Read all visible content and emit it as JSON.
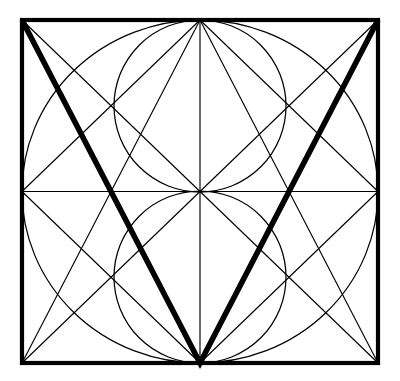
{
  "figure": {
    "background_color": "#ffffff",
    "ink_color": "#000000",
    "canvas": {
      "width": 400,
      "height": 381
    },
    "square": {
      "name": "outer-square",
      "left": 22,
      "top": 20,
      "right": 378,
      "bottom": 363,
      "width": 356,
      "height": 343,
      "stroke_width": 4.2
    },
    "center": {
      "x": 200,
      "y": 191.5
    },
    "circles": [
      {
        "name": "large-inscribed-circle",
        "cx": 200,
        "cy": 191.5,
        "rx": 178,
        "ry": 171.5,
        "stroke_width": 1.25
      },
      {
        "name": "upper-small-circle",
        "cx": 200,
        "cy": 106,
        "rx": 86,
        "ry": 86,
        "stroke_width": 1.25
      },
      {
        "name": "lower-small-circle",
        "cx": 200,
        "cy": 277,
        "rx": 86,
        "ry": 86,
        "stroke_width": 1.25
      }
    ],
    "axes": [
      {
        "name": "horizontal-median",
        "x1": 22,
        "y1": 191.5,
        "x2": 378,
        "y2": 191.5
      },
      {
        "name": "vertical-median",
        "x1": 200,
        "y1": 20,
        "x2": 200,
        "y2": 363
      }
    ],
    "thin_lines": [
      {
        "name": "diagonal-tl-to-br",
        "x1": 22,
        "y1": 20,
        "x2": 378,
        "y2": 363
      },
      {
        "name": "diagonal-tr-to-bl",
        "x1": 378,
        "y1": 20,
        "x2": 22,
        "y2": 363
      },
      {
        "name": "line-tl-to-bottom-center",
        "x1": 22,
        "y1": 20,
        "x2": 200,
        "y2": 363
      },
      {
        "name": "line-tr-to-bottom-center",
        "x1": 378,
        "y1": 20,
        "x2": 200,
        "y2": 363
      },
      {
        "name": "line-bl-to-top-center",
        "x1": 22,
        "y1": 363,
        "x2": 200,
        "y2": 20
      },
      {
        "name": "line-br-to-top-center",
        "x1": 378,
        "y1": 363,
        "x2": 200,
        "y2": 20
      },
      {
        "name": "line-top-center-to-left-mid",
        "x1": 200,
        "y1": 20,
        "x2": 22,
        "y2": 191.5
      },
      {
        "name": "line-top-center-to-right-mid",
        "x1": 200,
        "y1": 20,
        "x2": 378,
        "y2": 191.5
      },
      {
        "name": "line-bottom-center-to-left-mid",
        "x1": 200,
        "y1": 363,
        "x2": 22,
        "y2": 191.5
      },
      {
        "name": "line-bottom-center-to-right-mid",
        "x1": 200,
        "y1": 363,
        "x2": 378,
        "y2": 191.5
      }
    ],
    "bold_chevron": {
      "name": "bold-v-chevron",
      "points": "22,20 200,363 378,20",
      "stroke_width": 5.6,
      "apex": {
        "x": 200,
        "y": 363
      },
      "left_end": {
        "x": 22,
        "y": 20
      },
      "right_end": {
        "x": 378,
        "y": 20
      }
    }
  }
}
